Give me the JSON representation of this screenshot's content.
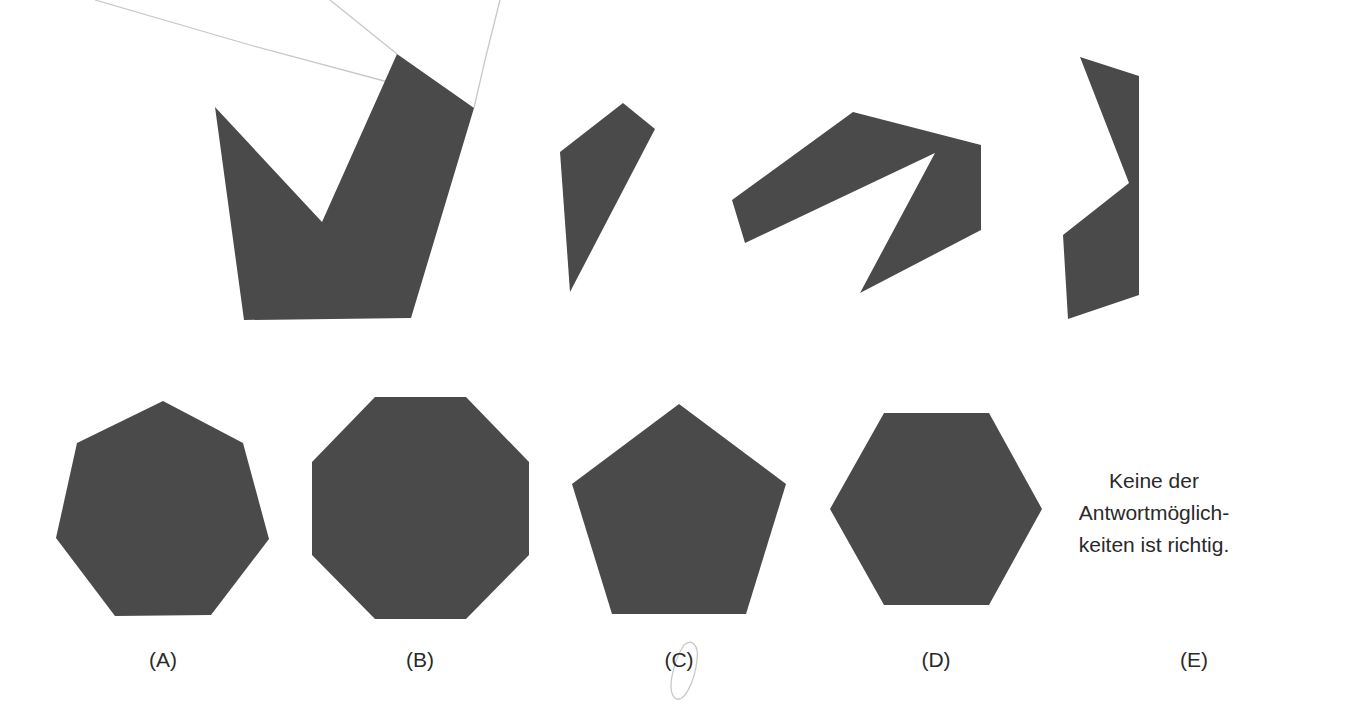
{
  "figure": {
    "colors": {
      "shape_fill": "#4a4a4a",
      "pencil_mark": "#c8c8c8",
      "text": "#2a2a2a",
      "background": "#ffffff"
    },
    "pieces": [
      {
        "id": "piece-1",
        "points": "215,107 322,222 397,54 474,108 411,318 244,320"
      },
      {
        "id": "piece-2",
        "points": "560,152 623,103 655,129 570,292"
      },
      {
        "id": "piece-3",
        "points": "732,200 853,112 981,145 981,230 860,293 935,153 745,243"
      },
      {
        "id": "piece-4",
        "points": "1080,57 1139,76 1139,295 1068,319 1063,235 1129,183"
      }
    ],
    "pencil_marks": [
      {
        "points": "95,0 250,45 388,82"
      },
      {
        "points": "330,0 397,54"
      },
      {
        "points": "500,0 485,60 474,108"
      }
    ],
    "answer_choices": [
      {
        "label": "(A)",
        "shape": "heptagon",
        "points": "163,401 243,443 269,539 211,615 115,616 56,538 77,443",
        "label_x": 163
      },
      {
        "label": "(B)",
        "shape": "octagon",
        "points": "375,397 466,397 529,462 529,555 466,619 375,619 312,555 312,462",
        "label_x": 420
      },
      {
        "label": "(C)",
        "shape": "pentagon",
        "points": "679,404 786,484 746,614 612,614 572,484",
        "label_x": 679
      },
      {
        "label": "(D)",
        "shape": "hexagon",
        "points": "884,413 989,413 1042,509 989,605 884,605 830,509",
        "label_x": 936
      },
      {
        "label": "(E)",
        "shape": "none",
        "label_x": 1194
      }
    ],
    "option_e_text": [
      "Keine der",
      "Antwortmöglich-",
      "keiten ist richtig."
    ]
  }
}
